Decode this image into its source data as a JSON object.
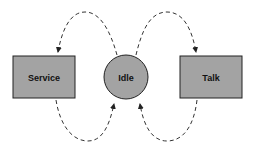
{
  "diagram": {
    "nodes": [
      {
        "id": "service",
        "label": "Service",
        "shape": "rectangle"
      },
      {
        "id": "idle",
        "label": "Idle",
        "shape": "circle"
      },
      {
        "id": "talk",
        "label": "Talk",
        "shape": "rectangle"
      }
    ],
    "edges": [
      {
        "from": "idle",
        "to": "service",
        "style": "dashed"
      },
      {
        "from": "service",
        "to": "idle",
        "style": "dashed"
      },
      {
        "from": "idle",
        "to": "talk",
        "style": "dashed"
      },
      {
        "from": "talk",
        "to": "idle",
        "style": "dashed"
      }
    ],
    "colors": {
      "node_fill": "#a3a3a3",
      "stroke": "#222222",
      "background": "#ffffff"
    }
  }
}
